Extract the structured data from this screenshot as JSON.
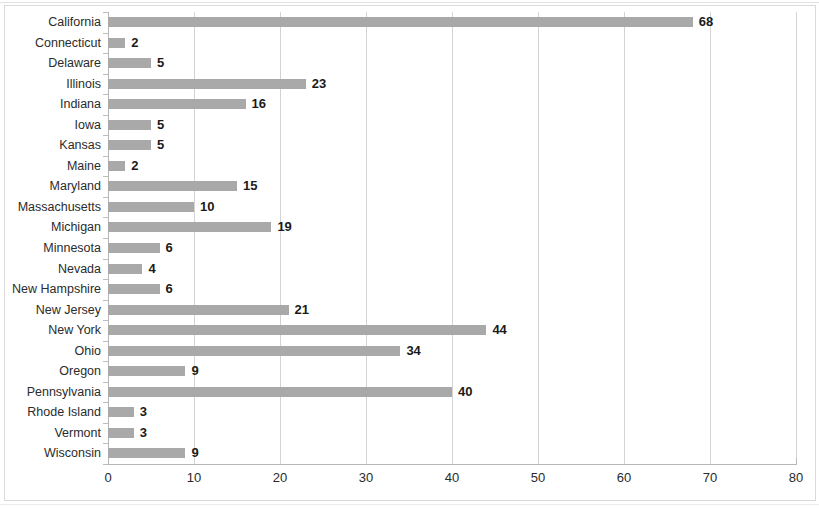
{
  "chart_data": {
    "type": "bar",
    "orientation": "horizontal",
    "title": "",
    "subtitle": "",
    "xlabel": "",
    "ylabel": "",
    "xlim": [
      0,
      80
    ],
    "xticks": [
      0,
      10,
      20,
      30,
      40,
      50,
      60,
      70,
      80
    ],
    "xtick_labels": [
      "0",
      "10",
      "20",
      "30",
      "40",
      "50",
      "60",
      "70",
      "80"
    ],
    "grid": "vertical",
    "legend": null,
    "bar_color": "#a9a9a9",
    "label_color": "#1a1a1a",
    "data_labels": true,
    "categories": [
      "California",
      "Connecticut",
      "Delaware",
      "Illinois",
      "Indiana",
      "Iowa",
      "Kansas",
      "Maine",
      "Maryland",
      "Massachusetts",
      "Michigan",
      "Minnesota",
      "Nevada",
      "New Hampshire",
      "New Jersey",
      "New York",
      "Ohio",
      "Oregon",
      "Pennsylvania",
      "Rhode Island",
      "Vermont",
      "Wisconsin"
    ],
    "values": [
      68,
      2,
      5,
      23,
      16,
      5,
      5,
      2,
      15,
      10,
      19,
      6,
      4,
      6,
      21,
      44,
      34,
      9,
      40,
      3,
      3,
      9
    ],
    "value_labels": [
      "68",
      "2",
      "5",
      "23",
      "16",
      "5",
      "5",
      "2",
      "15",
      "10",
      "19",
      "6",
      "4",
      "6",
      "21",
      "44",
      "34",
      "9",
      "40",
      "3",
      "3",
      "9"
    ]
  }
}
